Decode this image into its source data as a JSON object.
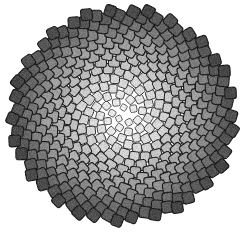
{
  "image": {
    "title": "Phyllotaxis spiral tiling",
    "width": 251,
    "height": 233,
    "background_color": "#ffffff"
  },
  "pattern": {
    "name": "golden-angle-phyllotaxis",
    "center_x": 123,
    "center_y": 115,
    "point_count": 420,
    "divergence_angle_deg": 137.508,
    "radius_scale": 5.55,
    "max_radius": 112,
    "cell_base_size": 11.4,
    "cell_corner_radius": 2.6,
    "cell_rotation_offset_deg": 18,
    "gap_color": "#1d1d1d",
    "gap_width": 1.15,
    "texture_noise_amount": 0.1,
    "ellipse_x_scale": 1.0,
    "ellipse_y_scale": 0.955
  },
  "chart_data": {
    "type": "scatter",
    "xlabel": "",
    "ylabel": "",
    "grid": false,
    "legend": null,
    "xlim": [
      22,
      232
    ],
    "ylim": [
      12,
      222
    ],
    "colormap_stops": [
      {
        "t": 0.0,
        "color": "#f2f2f2"
      },
      {
        "t": 0.18,
        "color": "#e6e6e6"
      },
      {
        "t": 0.38,
        "color": "#d2d2d2"
      },
      {
        "t": 0.56,
        "color": "#b4b4b4"
      },
      {
        "t": 0.72,
        "color": "#949494"
      },
      {
        "t": 0.85,
        "color": "#6f6f6f"
      },
      {
        "t": 0.94,
        "color": "#585858"
      },
      {
        "t": 1.0,
        "color": "#464646"
      }
    ]
  },
  "colors": {
    "center_light": "#f2f2f2",
    "mid_gray": "#b4b4b4",
    "outer_dark": "#464646",
    "outline": "#1d1d1d",
    "background": "#ffffff"
  }
}
